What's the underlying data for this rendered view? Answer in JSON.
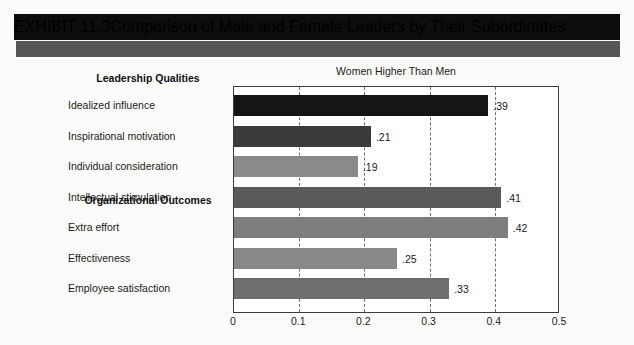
{
  "exhibit": {
    "number": "EXHIBIT 11.3",
    "title": "Comparison of Male and Female Leaders by Their Subordinates"
  },
  "chart_data": {
    "type": "bar",
    "orientation": "horizontal",
    "title": "Women Higher Than Men",
    "xlabel": "",
    "ylabel": "",
    "xlim": [
      0,
      0.5
    ],
    "xticks": [
      "0",
      "0.1",
      "0.2",
      "0.3",
      "0.4",
      "0.5"
    ],
    "xtick_values": [
      0,
      0.1,
      0.2,
      0.3,
      0.4,
      0.5
    ],
    "grid": "vertical-dashed",
    "legend": "none",
    "groups": [
      {
        "heading": "Leadership Qualities",
        "categories": [
          "Idealized influence",
          "Inspirational motivation",
          "Individual consideration",
          "Intellectual stimulation"
        ],
        "values": [
          0.39,
          0.21,
          0.19,
          0.41
        ],
        "labels": [
          ".39",
          ".21",
          ".19",
          ".41"
        ],
        "colors": [
          "#151515",
          "#3a3a3a",
          "#8a8a8a",
          "#5a5a5a"
        ]
      },
      {
        "heading": "Organizational Outcomes",
        "categories": [
          "Extra effort",
          "Effectiveness",
          "Employee satisfaction"
        ],
        "values": [
          0.42,
          0.25,
          0.33
        ],
        "labels": [
          ".42",
          ".25",
          ".33"
        ],
        "colors": [
          "#7e7e7e",
          "#888888",
          "#6e6e6e"
        ]
      }
    ],
    "categories": [
      "Idealized influence",
      "Inspirational motivation",
      "Individual consideration",
      "Intellectual stimulation",
      "Extra effort",
      "Effectiveness",
      "Employee satisfaction"
    ],
    "values": [
      0.39,
      0.21,
      0.19,
      0.41,
      0.42,
      0.25,
      0.33
    ]
  },
  "colors": {
    "header_bar": "#0d0d0d",
    "header_accent": "#565656",
    "page_background": "#fbfbfa",
    "plot_border": "#3b3b3b",
    "gridline": "#6f6f6f"
  }
}
